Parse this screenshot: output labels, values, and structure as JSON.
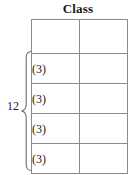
{
  "figure": {
    "title": "Class",
    "table": {
      "columns": [
        "left",
        "right"
      ],
      "header_row": {
        "left": "",
        "right": ""
      },
      "rows": [
        {
          "left": "(3)",
          "right": ""
        },
        {
          "left": "(3)",
          "right": ""
        },
        {
          "left": "(3)",
          "right": ""
        },
        {
          "left": "(3)",
          "right": ""
        }
      ]
    },
    "brace": {
      "label": "12",
      "icon": "curly-brace-left-icon",
      "spans_rows": 4
    },
    "colors": {
      "line": "#8b8b8b",
      "text": "#1a1a1a",
      "background": "#ffffff"
    }
  }
}
